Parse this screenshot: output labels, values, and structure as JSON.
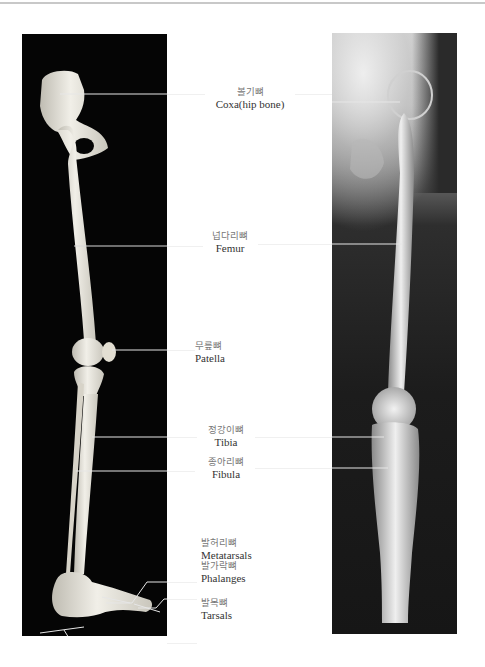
{
  "figure": {
    "panels": [
      {
        "name": "skeleton-model",
        "description": "Lateral view of right leg skeleton on black background"
      },
      {
        "name": "xray",
        "description": "Radiograph of hip, femur, knee and lower leg"
      }
    ]
  },
  "labels": [
    {
      "id": "coxa",
      "ko": "볼기뼈",
      "en": "Coxa(hip bone)"
    },
    {
      "id": "femur",
      "ko": "넙다리뼈",
      "en": "Femur"
    },
    {
      "id": "patella",
      "ko": "무릎뼈",
      "en": "Patella"
    },
    {
      "id": "tibia",
      "ko": "정강이뼈",
      "en": "Tibia"
    },
    {
      "id": "fibula",
      "ko": "종아리뼈",
      "en": "Fibula"
    },
    {
      "id": "metatarsals",
      "ko": "발허리뼈",
      "en": "Metatarsals"
    },
    {
      "id": "phalanges",
      "ko": "발가락뼈",
      "en": "Phalanges"
    },
    {
      "id": "tarsals",
      "ko": "발목뼈",
      "en": "Tarsals"
    }
  ],
  "colors": {
    "background": "#ffffff",
    "skeleton_panel": "#050505",
    "bone": "#e9e6dc",
    "leader_line": "#e6e6e6",
    "label_text": "#333333"
  }
}
